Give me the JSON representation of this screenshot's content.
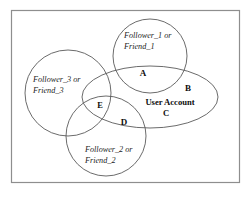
{
  "figure": {
    "background_color": "#ffffff",
    "border_color": "#8e8e8e",
    "stroke_color": "#585858",
    "text_color": "#141414"
  },
  "diagram": {
    "type": "venn",
    "frame": {
      "x": 11,
      "y": 10,
      "width": 229,
      "height": 173
    },
    "sets": [
      {
        "id": "follower_1",
        "shape": "circle",
        "label_line_1": "Follower_1 or",
        "label_line_2": "Friend_1",
        "cx": 150,
        "cy": 56,
        "r": 37
      },
      {
        "id": "follower_3",
        "shape": "circle",
        "label_line_1": "Follower_3 or",
        "label_line_2": "Friend_3",
        "cx": 68,
        "cy": 93,
        "r": 43
      },
      {
        "id": "follower_2",
        "shape": "circle",
        "label_line_1": "Follower_2 or",
        "label_line_2": "Friend_2",
        "cx": 106,
        "cy": 136,
        "r": 40
      },
      {
        "id": "user_account",
        "shape": "ellipse",
        "label": "User Account",
        "cx": 150,
        "cy": 97,
        "rx": 68,
        "ry": 31
      }
    ],
    "region_labels": [
      {
        "id": "A",
        "text": "A",
        "x": 143,
        "y": 76
      },
      {
        "id": "B",
        "text": "B",
        "x": 188,
        "y": 91
      },
      {
        "id": "C",
        "text": "C",
        "x": 166,
        "y": 116
      },
      {
        "id": "D",
        "text": "D",
        "x": 124,
        "y": 125
      },
      {
        "id": "E",
        "text": "E",
        "x": 100,
        "y": 108
      }
    ]
  }
}
